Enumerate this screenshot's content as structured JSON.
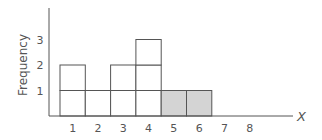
{
  "chart_data": {
    "type": "bar",
    "subtype": "dot-histogram (stacked unit boxes)",
    "title": "",
    "xlabel": "X",
    "ylabel": "Frequency",
    "categories": [
      "1",
      "2",
      "3",
      "4",
      "5",
      "6",
      "7",
      "8"
    ],
    "values": [
      2,
      1,
      2,
      3,
      1,
      1,
      0,
      0
    ],
    "shaded_categories": [
      "5",
      "6"
    ],
    "y_ticks": [
      "1",
      "2",
      "3"
    ],
    "x_ticks": [
      "1",
      "2",
      "3",
      "4",
      "5",
      "6",
      "7",
      "8"
    ],
    "ylim": [
      0,
      4
    ],
    "grid": false,
    "legend": null,
    "colors": {
      "box_fill": "#ffffff",
      "shaded_fill": "#d4d4d4",
      "line": "#555555",
      "text": "#555555"
    }
  }
}
